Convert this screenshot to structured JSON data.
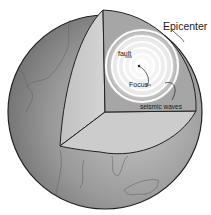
{
  "diagram": {
    "labels": {
      "epicenter": "Epicenter",
      "fault": "fault",
      "focus": "Focus",
      "seismic_waves": "seismic waves"
    },
    "colors": {
      "sphere_dark": "#7a7a7a",
      "sphere_light": "#b8b8b8",
      "cut_face": "#c8c8c8",
      "back_face": "#a8a8a8",
      "waves": "#ffffff",
      "outline": "#222222"
    }
  }
}
